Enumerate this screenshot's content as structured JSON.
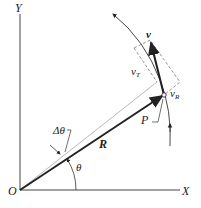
{
  "diagram": {
    "labels": {
      "origin": "O",
      "x_axis": "X",
      "y_axis": "Y",
      "radius_vector": "R",
      "point": "P",
      "velocity": "v",
      "tangential_velocity": "v",
      "tangential_sub": "T",
      "radial_velocity": "v",
      "radial_sub": "R",
      "angle": "θ",
      "delta_angle": "Δθ"
    },
    "colors": {
      "stroke": "#222222",
      "light_stroke": "#888888",
      "background": "#ffffff"
    }
  }
}
